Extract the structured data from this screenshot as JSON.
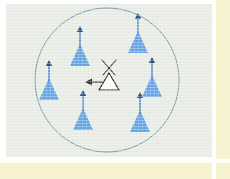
{
  "figure": {
    "caption": "",
    "background_color": "#e6ebe4",
    "scan_border_color": "#f7f2cf",
    "page_color": "#ffffff"
  },
  "chart_data": {
    "type": "diagram",
    "xlabel": "",
    "ylabel": "",
    "xlim": [
      0,
      206
    ],
    "ylim": [
      0,
      153
    ],
    "grid": false,
    "legend": "none",
    "coverage_circle": {
      "label": "coverage-area-boundary",
      "cx": 101,
      "cy": 76,
      "r": 72,
      "stroke": "#7f93ab",
      "stroke_width": 1,
      "fill": "none"
    },
    "nodes": [
      {
        "id": "tower-1",
        "label": "antenna-tower",
        "kind": "remote-antenna",
        "fill": "#66a3e0",
        "x": 74,
        "y": 46,
        "scale": 1.0
      },
      {
        "id": "tower-2",
        "label": "antenna-tower",
        "kind": "remote-antenna",
        "fill": "#66a3e0",
        "x": 132,
        "y": 33,
        "scale": 1.0
      },
      {
        "id": "tower-3",
        "label": "antenna-tower",
        "kind": "remote-antenna",
        "fill": "#66a3e0",
        "x": 43,
        "y": 80,
        "scale": 1.0
      },
      {
        "id": "tower-4",
        "label": "antenna-tower",
        "kind": "remote-antenna",
        "fill": "#66a3e0",
        "x": 146,
        "y": 77,
        "scale": 1.0
      },
      {
        "id": "tower-5",
        "label": "antenna-tower",
        "kind": "remote-antenna",
        "fill": "#66a3e0",
        "x": 77,
        "y": 110,
        "scale": 1.0
      },
      {
        "id": "tower-6",
        "label": "antenna-tower",
        "kind": "remote-antenna",
        "fill": "#66a3e0",
        "x": 134,
        "y": 112,
        "scale": 1.0
      }
    ],
    "hub": {
      "id": "hub-1",
      "label": "central-base-station",
      "kind": "base-station",
      "fill": "#fbfcfa",
      "stroke": "#2b2b2b",
      "x": 103,
      "y": 76,
      "has_crossed_antenna": true,
      "arrow_direction": "left"
    },
    "annotations": []
  },
  "icons": {
    "tower": "antenna-tower-icon",
    "hub": "base-station-icon",
    "arrow": "arrow-left-icon",
    "cross": "crossed-antenna-icon",
    "circle": "coverage-circle-icon"
  }
}
